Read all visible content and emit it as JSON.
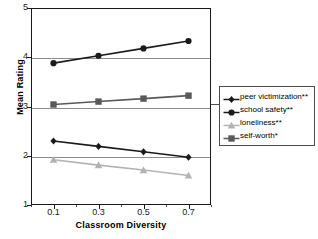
{
  "chart_data": {
    "type": "line",
    "title": "",
    "xlabel": "Classroom Diversity",
    "ylabel": "Mean Rating",
    "x": [
      0.1,
      0.3,
      0.5,
      0.7
    ],
    "xtick_labels": [
      "0.1",
      "0.3",
      "0.5",
      "0.7"
    ],
    "ytick_labels": [
      "1",
      "2",
      "3",
      "4",
      "5"
    ],
    "ylim": [
      1,
      5
    ],
    "xlim": [
      0.0,
      0.8
    ],
    "grid": "horizontal-major",
    "legend_position": "right-outside",
    "series": [
      {
        "name": "peer victimization**",
        "values": [
          2.3,
          2.19,
          2.08,
          1.97
        ],
        "color": "#1a1a1a",
        "marker": "diamond"
      },
      {
        "name": "school safety**",
        "values": [
          3.88,
          4.03,
          4.18,
          4.33
        ],
        "color": "#1a1a1a",
        "marker": "circle"
      },
      {
        "name": "loneliness**",
        "values": [
          1.92,
          1.81,
          1.71,
          1.6
        ],
        "color": "#b3b3b3",
        "marker": "triangle"
      },
      {
        "name": "self-worth*",
        "values": [
          3.04,
          3.1,
          3.16,
          3.22
        ],
        "color": "#595959",
        "marker": "square"
      }
    ]
  },
  "legend": {
    "items": [
      {
        "label": "peer victimization**",
        "color": "#1a1a1a",
        "marker": "diamond"
      },
      {
        "label": "school safety**",
        "color": "#1a1a1a",
        "marker": "circle"
      },
      {
        "label": "loneliness**",
        "color": "#b3b3b3",
        "marker": "triangle"
      },
      {
        "label": "self-worth*",
        "color": "#595959",
        "marker": "square"
      }
    ]
  }
}
